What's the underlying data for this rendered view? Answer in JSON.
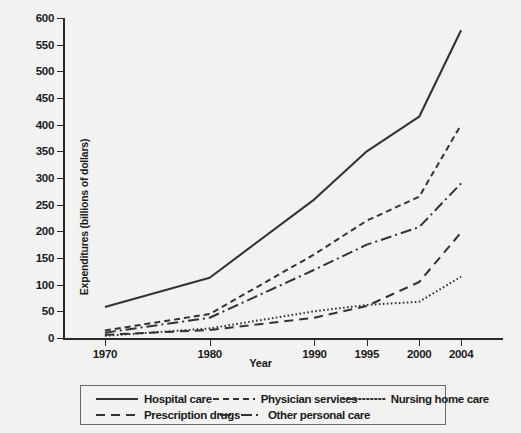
{
  "chart_data": {
    "type": "line",
    "title": "",
    "xlabel": "Year",
    "ylabel": "Expenditures (billions of dollars)",
    "x": [
      1970,
      1980,
      1990,
      1995,
      2000,
      2004
    ],
    "xtick_labels": [
      "1970",
      "1980",
      "1990",
      "1995",
      "2000",
      "2004"
    ],
    "xlim": [
      1966,
      2008
    ],
    "ylim": [
      0,
      600
    ],
    "ytick_labels": [
      "0",
      "50",
      "100",
      "150",
      "200",
      "250",
      "300",
      "350",
      "400",
      "450",
      "500",
      "550",
      "600"
    ],
    "ytick_values": [
      0,
      50,
      100,
      150,
      200,
      250,
      300,
      350,
      400,
      450,
      500,
      550,
      600
    ],
    "grid": false,
    "legend_position": "below",
    "series": [
      {
        "name": "Hospital care",
        "style": "solid",
        "dash": "none",
        "values": [
          58,
          113,
          260,
          350,
          415,
          577
        ]
      },
      {
        "name": "Physician services",
        "style": "dashed",
        "dash": "6,4",
        "values": [
          14,
          45,
          157,
          220,
          265,
          400
        ]
      },
      {
        "name": "Nursing home care",
        "style": "dotted",
        "dash": "1.6,2.4",
        "values": [
          4,
          18,
          50,
          62,
          68,
          115
        ]
      },
      {
        "name": "Prescription drugs",
        "style": "long-dash",
        "dash": "9,6",
        "values": [
          6,
          15,
          38,
          60,
          105,
          198
        ]
      },
      {
        "name": "Other personal care",
        "style": "dash-dot",
        "dash": "11,4,2,4",
        "values": [
          10,
          38,
          128,
          175,
          208,
          290
        ]
      }
    ],
    "colors": {
      "line": "#333333",
      "axis": "#2a2a2a",
      "text": "#1b1b1b",
      "background": "#f2f2f0",
      "legend_border": "#6a6a6a"
    }
  },
  "legend": {
    "rows": [
      [
        "Hospital care",
        "Physician services",
        "Nursing home care"
      ],
      [
        "Prescription drugs",
        "Other personal care"
      ]
    ]
  }
}
